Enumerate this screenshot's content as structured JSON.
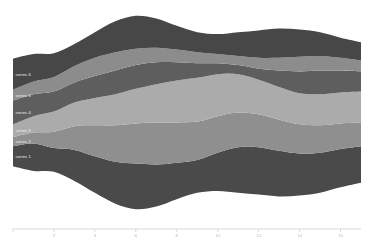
{
  "chart_data": {
    "type": "area",
    "variant": "streamgraph",
    "title": "",
    "xlabel": "",
    "ylabel": "",
    "grid": false,
    "legend_position": "inline-left-labels",
    "offset": "wiggle",
    "x": [
      0,
      1,
      2,
      3,
      4,
      5,
      6,
      7,
      8,
      9,
      10,
      11,
      12,
      13,
      14,
      15,
      16,
      17
    ],
    "xlim": [
      0,
      17
    ],
    "xticks": [
      2,
      4,
      6,
      8,
      10,
      12,
      14,
      16
    ],
    "xtick_labels": [
      "2",
      "4",
      "6",
      "8",
      "10",
      "12",
      "14",
      "16"
    ],
    "colors": [
      "#4a4a4a",
      "#8f8f8f",
      "#ababab",
      "#5e5e5e",
      "#8c8c8c",
      "#474747"
    ],
    "series": [
      {
        "name": "series-1",
        "label": "series 1",
        "color": "#4a4a4a",
        "values": [
          22,
          30,
          26,
          34,
          40,
          46,
          50,
          46,
          40,
          36,
          42,
          50,
          52,
          50,
          46,
          44,
          42,
          40
        ]
      },
      {
        "name": "series-2",
        "label": "series 2",
        "color": "#8f8f8f",
        "values": [
          10,
          12,
          18,
          26,
          34,
          40,
          44,
          46,
          44,
          42,
          40,
          38,
          36,
          34,
          32,
          30,
          28,
          26
        ]
      },
      {
        "name": "series-3",
        "label": "series 3",
        "color": "#ababab",
        "values": [
          14,
          18,
          22,
          26,
          30,
          34,
          38,
          42,
          46,
          48,
          46,
          42,
          38,
          36,
          34,
          34,
          34,
          34
        ]
      },
      {
        "name": "series-4",
        "label": "series 4",
        "color": "#5e5e5e",
        "values": [
          26,
          24,
          22,
          22,
          24,
          26,
          26,
          24,
          20,
          16,
          12,
          10,
          12,
          18,
          24,
          26,
          24,
          22
        ]
      },
      {
        "name": "series-5",
        "label": "series 5",
        "color": "#8c8c8c",
        "values": [
          12,
          14,
          16,
          18,
          20,
          20,
          18,
          16,
          14,
          12,
          10,
          10,
          12,
          14,
          16,
          16,
          14,
          12
        ]
      },
      {
        "name": "series-6",
        "label": "series 6",
        "color": "#474747",
        "values": [
          34,
          30,
          26,
          24,
          28,
          34,
          36,
          32,
          26,
          22,
          22,
          26,
          30,
          32,
          30,
          26,
          22,
          20
        ]
      }
    ]
  },
  "plot_area": {
    "left": 13,
    "top": 10,
    "width": 348,
    "height": 205
  },
  "axis": {
    "line_color": "#c9c9c9",
    "tick_label_color": "#b9b9b9",
    "y": 229
  }
}
